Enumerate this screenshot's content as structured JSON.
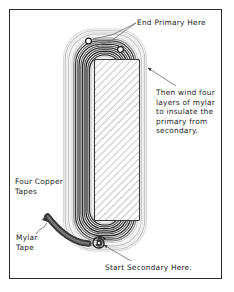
{
  "diagram": {
    "frame": {
      "border_color": "#2a2a2a",
      "background": "#ffffff"
    },
    "colors": {
      "copper_dark": "#2b2b2b",
      "copper_mid": "#555555",
      "mylar_light": "#c9c9c9",
      "mylar_pale": "#e6e6e6",
      "core_hatch": "#b9b9b9",
      "leader_line": "#6b6b6b",
      "text": "#1c1c1c"
    },
    "labels": {
      "end_primary": "End Primary Here",
      "mylar_note": "Then wind four\nlayers of mylar\nto insulate the\nprimary from\nsecondary.",
      "four_copper_tapes": "Four Copper\nTapes",
      "mylar_tape": "Mylar\nTape",
      "start_secondary": "Start Secondary Here."
    },
    "parts": {
      "core": "hatched-core",
      "copper_winding": "copper-tape-winding",
      "mylar_wrap": "mylar-insulation-layers",
      "primary_terminal_a": "primary-terminal-left",
      "primary_terminal_b": "primary-terminal-right",
      "secondary_terminal": "secondary-start-terminal",
      "tape_lead": "copper-tape-lead-ribbon"
    }
  }
}
